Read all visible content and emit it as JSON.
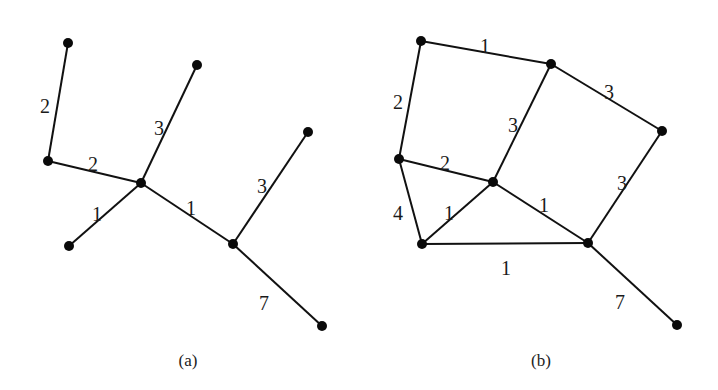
{
  "figures": [
    {
      "id": "a",
      "caption": "(a)",
      "caption_pos": [
        188,
        366
      ],
      "nodes": [
        {
          "id": "a1",
          "x": 68,
          "y": 43
        },
        {
          "id": "a2",
          "x": 197,
          "y": 65
        },
        {
          "id": "a3",
          "x": 48,
          "y": 161
        },
        {
          "id": "a4",
          "x": 141,
          "y": 183
        },
        {
          "id": "a5",
          "x": 308,
          "y": 132
        },
        {
          "id": "a6",
          "x": 69,
          "y": 246
        },
        {
          "id": "a7",
          "x": 233,
          "y": 244
        },
        {
          "id": "a8",
          "x": 322,
          "y": 326
        }
      ],
      "edges": [
        {
          "from": "a1",
          "to": "a3",
          "weight": "2",
          "label_pos": [
            45,
            108
          ]
        },
        {
          "from": "a3",
          "to": "a4",
          "weight": "2",
          "label_pos": [
            93,
            166
          ]
        },
        {
          "from": "a4",
          "to": "a2",
          "weight": "3",
          "label_pos": [
            159,
            130
          ]
        },
        {
          "from": "a4",
          "to": "a6",
          "weight": "1",
          "label_pos": [
            97,
            216
          ]
        },
        {
          "from": "a4",
          "to": "a7",
          "weight": "1",
          "label_pos": [
            191,
            210
          ]
        },
        {
          "from": "a7",
          "to": "a5",
          "weight": "3",
          "label_pos": [
            262,
            188
          ]
        },
        {
          "from": "a7",
          "to": "a8",
          "weight": "7",
          "label_pos": [
            264,
            305
          ]
        }
      ]
    },
    {
      "id": "b",
      "caption": "(b)",
      "caption_pos": [
        541,
        366
      ],
      "nodes": [
        {
          "id": "b1",
          "x": 421,
          "y": 41
        },
        {
          "id": "b2",
          "x": 551,
          "y": 64
        },
        {
          "id": "b3",
          "x": 662,
          "y": 131
        },
        {
          "id": "b4",
          "x": 399,
          "y": 159
        },
        {
          "id": "b5",
          "x": 493,
          "y": 182
        },
        {
          "id": "b6",
          "x": 422,
          "y": 244
        },
        {
          "id": "b7",
          "x": 588,
          "y": 243
        },
        {
          "id": "b8",
          "x": 677,
          "y": 325
        }
      ],
      "edges": [
        {
          "from": "b1",
          "to": "b2",
          "weight": "1",
          "label_pos": [
            485,
            48
          ]
        },
        {
          "from": "b1",
          "to": "b4",
          "weight": "2",
          "label_pos": [
            398,
            104
          ]
        },
        {
          "from": "b2",
          "to": "b3",
          "weight": "3",
          "label_pos": [
            609,
            94
          ]
        },
        {
          "from": "b2",
          "to": "b5",
          "weight": "3",
          "label_pos": [
            513,
            127
          ]
        },
        {
          "from": "b4",
          "to": "b5",
          "weight": "2",
          "label_pos": [
            445,
            165
          ]
        },
        {
          "from": "b4",
          "to": "b6",
          "weight": "4",
          "label_pos": [
            398,
            215
          ]
        },
        {
          "from": "b5",
          "to": "b6",
          "weight": "1",
          "label_pos": [
            449,
            215
          ]
        },
        {
          "from": "b5",
          "to": "b7",
          "weight": "1",
          "label_pos": [
            544,
            207
          ]
        },
        {
          "from": "b3",
          "to": "b7",
          "weight": "3",
          "label_pos": [
            622,
            185
          ]
        },
        {
          "from": "b6",
          "to": "b7",
          "weight": "1",
          "label_pos": [
            506,
            270
          ]
        },
        {
          "from": "b7",
          "to": "b8",
          "weight": "7",
          "label_pos": [
            620,
            304
          ]
        }
      ]
    }
  ]
}
